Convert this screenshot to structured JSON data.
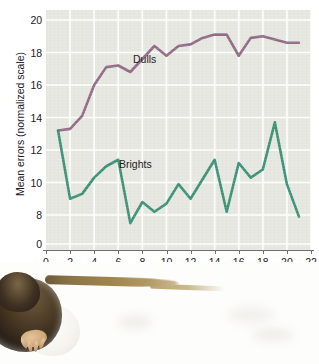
{
  "figure": {
    "photo_caption_alt": "rat-photograph"
  },
  "chart_data": {
    "type": "line",
    "title": "",
    "xlabel": "Number of selected generations",
    "ylabel": "Mean errors (normalized scale)",
    "xlim": [
      0,
      22
    ],
    "ylim": [
      7,
      20
    ],
    "y_axis_break": true,
    "y_axis_zero_label": "0",
    "grid": true,
    "legend_position": "inline-annotations",
    "xticks": [
      0,
      2,
      4,
      6,
      8,
      10,
      12,
      14,
      16,
      18,
      20,
      22
    ],
    "xtick_labels": [
      "0",
      "2",
      "4",
      "6",
      "8",
      "10",
      "12",
      "14",
      "16",
      "18",
      "20",
      "22"
    ],
    "yticks": [
      8,
      10,
      12,
      14,
      16,
      18,
      20
    ],
    "ytick_labels": [
      "8",
      "10",
      "12",
      "14",
      "16",
      "18",
      "20"
    ],
    "x": [
      1,
      2,
      3,
      4,
      5,
      6,
      7,
      8,
      9,
      10,
      11,
      12,
      13,
      14,
      15,
      16,
      17,
      18,
      19,
      20,
      21
    ],
    "series": [
      {
        "name": "Dulls",
        "color": "#8a6280",
        "label_text": "Dulls",
        "values": [
          13.2,
          13.3,
          14.1,
          16.0,
          17.1,
          17.2,
          16.8,
          17.6,
          18.4,
          17.8,
          18.4,
          18.5,
          18.9,
          19.1,
          19.1,
          17.8,
          18.9,
          19.0,
          18.8,
          18.6,
          18.6
        ]
      },
      {
        "name": "Brights",
        "color": "#2e8b70",
        "label_text": "Brights",
        "values": [
          13.2,
          9.0,
          9.3,
          10.3,
          11.0,
          11.4,
          7.5,
          8.8,
          8.2,
          8.7,
          9.9,
          9.0,
          10.2,
          11.4,
          8.2,
          11.2,
          10.3,
          10.8,
          13.7,
          9.9,
          7.9
        ]
      }
    ]
  },
  "colors": {
    "plot_background": "#e7e7e1",
    "gridline": "#ffffff",
    "axis": "#6e6e6e",
    "text": "#20201f",
    "dulls": "#8a6280",
    "brights": "#2e8b70"
  }
}
